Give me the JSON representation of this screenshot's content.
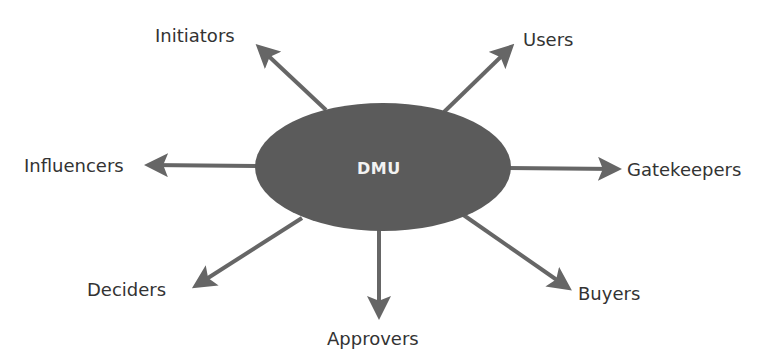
{
  "diagram": {
    "center": {
      "label": "DMU",
      "fill": "#5b5b5b",
      "text_color": "#f2f2f2"
    },
    "arrow_color": "#666666",
    "label_color": "#333333",
    "roles": [
      {
        "id": "initiators",
        "label": "Initiators"
      },
      {
        "id": "users",
        "label": "Users"
      },
      {
        "id": "influencers",
        "label": "Influencers"
      },
      {
        "id": "gatekeepers",
        "label": "Gatekeepers"
      },
      {
        "id": "deciders",
        "label": "Deciders"
      },
      {
        "id": "approvers",
        "label": "Approvers"
      },
      {
        "id": "buyers",
        "label": "Buyers"
      }
    ]
  }
}
